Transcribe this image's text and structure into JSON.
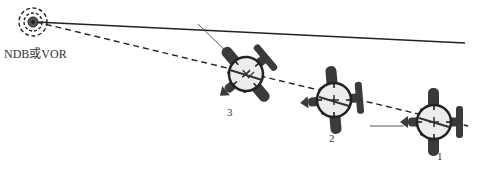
{
  "diagram": {
    "station": {
      "label": "NDB或VOR",
      "icon": "radio-beacon-icon"
    },
    "reference_line": {
      "style": "solid",
      "color": "#222222"
    },
    "bearing_line": {
      "style": "dashed",
      "color": "#222222"
    },
    "aircraft": [
      {
        "label": "3",
        "position": "nearest to station"
      },
      {
        "label": "2",
        "position": "middle"
      },
      {
        "label": "1",
        "position": "farthest from station"
      }
    ],
    "colors": {
      "aircraft": "#3a3a3a",
      "instrument_face": "#ececec",
      "instrument_ring": "#222222",
      "line": "#222222"
    }
  }
}
